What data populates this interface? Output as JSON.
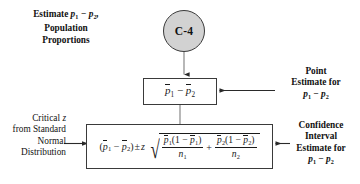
{
  "diagram": {
    "title_node": {
      "label": "C-4",
      "shape": "circle",
      "fill": "#d2d2d2",
      "stroke": "#3a3a3a"
    },
    "captions": {
      "estimate": {
        "line1_prefix": "Estimate ",
        "line1_math": "p1 - p2,",
        "line2": "Population",
        "line3": "Proportions"
      },
      "point_estimate": {
        "line1": "Point",
        "line2": "Estimate for",
        "line3_math": "p1 - p2"
      },
      "critical_z": {
        "line1_prefix": "Critical ",
        "line1_math": "z",
        "line2": "from Standard",
        "line3": "Normal",
        "line4": "Distribution"
      },
      "confidence_interval": {
        "line1": "Confidence",
        "line2": "Interval",
        "line3": "Estimate for",
        "line4_math": "p1 - p2"
      }
    },
    "boxes": {
      "point_estimate_formula": {
        "expression": "p-bar_1 - p-bar_2",
        "symbols": {
          "p": "p",
          "sub1": "1",
          "sub2": "2",
          "minus": "−"
        }
      },
      "confidence_interval_formula": {
        "expression": "(p-bar_1 - p-bar_2) +/- z * sqrt( p-bar_1(1 - p-bar_1)/n_1 + p-bar_2(1 - p-bar_2)/n_2 )",
        "symbols": {
          "p": "p",
          "n": "n",
          "z": "z",
          "plusminus": "±",
          "minus": "−",
          "plus": "+",
          "one": "1",
          "sub1": "1",
          "sub2": "2",
          "lparen": "(",
          "rparen": ")",
          "radical": "√"
        }
      }
    },
    "connectors": [
      {
        "name": "circle-to-point-box",
        "direction": "down",
        "arrowhead": true
      },
      {
        "name": "point-box-to-ci-box",
        "direction": "down",
        "arrowhead": false
      },
      {
        "name": "point-caption-to-point-box",
        "direction": "left",
        "arrowhead": true
      },
      {
        "name": "critical-z-caption-to-ci-box",
        "direction": "right",
        "arrowhead": true
      },
      {
        "name": "ci-caption-to-ci-box",
        "direction": "left",
        "arrowhead": true
      }
    ],
    "colors": {
      "stroke": "#3a3a3a",
      "text": "#111111",
      "background": "#ffffff",
      "node_fill": "#d2d2d2"
    }
  }
}
